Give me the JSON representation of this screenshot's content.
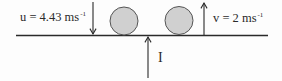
{
  "diagram": {
    "labels": {
      "u_text": "u = 4.43 ms",
      "u_exponent": "-1",
      "v_text": "v = 2 ms",
      "v_exponent": "-1",
      "impulse": "I"
    },
    "colors": {
      "line": "#2a2a2a",
      "ball_fill": "#d0d0d0",
      "ball_stroke": "#555555",
      "background": "#fdfdfd"
    },
    "elements": {
      "surface": "horizontal surface line",
      "balls": [
        "ball-1",
        "ball-2"
      ],
      "arrows": [
        "incoming velocity arrow (down)",
        "outgoing velocity arrow (up)",
        "impulse arrow (up)"
      ]
    }
  }
}
